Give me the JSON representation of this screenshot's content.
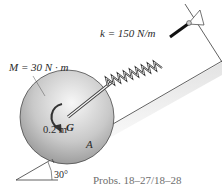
{
  "diagram": {
    "labels": {
      "spring_constant": "k = 150 N/m",
      "moment": "M = 30 N · m",
      "center": "G",
      "radius": "0.2 m",
      "contact_point": "A",
      "angle": "30°"
    },
    "caption": "Probs. 18–27/18–28",
    "colors": {
      "disk_light": "#f2f2f2",
      "disk_dark": "#8a8a8a",
      "line": "#3a3a3a",
      "caption": "#6e6e6e",
      "rod": "#1a1a1a"
    }
  }
}
